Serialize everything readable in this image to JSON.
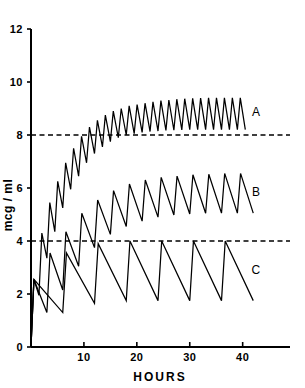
{
  "chart_data": {
    "type": "line",
    "title": "",
    "subtitle": "",
    "xlabel": "HOURS",
    "ylabel": "mcg / ml",
    "xlim": [
      0,
      48
    ],
    "ylim": [
      0,
      12
    ],
    "xticks": [
      10,
      20,
      30,
      40
    ],
    "xtick_labels": [
      "10",
      "20",
      "30",
      "40"
    ],
    "yticks": [
      0,
      2,
      4,
      6,
      8,
      10,
      12
    ],
    "ytick_labels": [
      "0",
      "2",
      "4",
      "6",
      "8",
      "10",
      "12"
    ],
    "grid": false,
    "legend": "inline-right-labels",
    "annotations": [
      {
        "name": "reference-line-8",
        "type": "hline",
        "y": 8,
        "style": "dashed"
      },
      {
        "name": "reference-line-4",
        "type": "hline",
        "y": 4,
        "style": "dashed"
      }
    ],
    "series": [
      {
        "name": "A",
        "label": "A",
        "label_x": 42.5,
        "label_y": 8.85,
        "dose_interval_hours": 1.5,
        "steady_state_peak": 9.4,
        "steady_state_trough": 8.2,
        "points": [
          [
            0.0,
            0.0
          ],
          [
            0.55,
            2.55
          ],
          [
            1.5,
            1.95
          ],
          [
            2.05,
            4.3
          ],
          [
            3.0,
            3.35
          ],
          [
            3.55,
            5.45
          ],
          [
            4.5,
            4.35
          ],
          [
            5.05,
            6.25
          ],
          [
            6.0,
            5.25
          ],
          [
            6.55,
            6.95
          ],
          [
            7.5,
            5.95
          ],
          [
            8.05,
            7.5
          ],
          [
            9.0,
            6.45
          ],
          [
            9.55,
            7.95
          ],
          [
            10.5,
            6.95
          ],
          [
            11.05,
            8.3
          ],
          [
            12.0,
            7.3
          ],
          [
            12.55,
            8.55
          ],
          [
            13.5,
            7.55
          ],
          [
            14.05,
            8.75
          ],
          [
            15.0,
            7.75
          ],
          [
            15.55,
            8.9
          ],
          [
            16.5,
            7.9
          ],
          [
            17.05,
            9.0
          ],
          [
            18.0,
            8.0
          ],
          [
            18.55,
            9.1
          ],
          [
            19.5,
            8.05
          ],
          [
            20.05,
            9.15
          ],
          [
            21.0,
            8.1
          ],
          [
            21.55,
            9.2
          ],
          [
            22.5,
            8.13
          ],
          [
            23.05,
            9.25
          ],
          [
            24.0,
            8.15
          ],
          [
            24.55,
            9.3
          ],
          [
            25.5,
            8.17
          ],
          [
            26.05,
            9.32
          ],
          [
            27.0,
            8.18
          ],
          [
            27.55,
            9.35
          ],
          [
            28.5,
            8.19
          ],
          [
            29.05,
            9.37
          ],
          [
            30.0,
            8.2
          ],
          [
            30.55,
            9.38
          ],
          [
            31.5,
            8.2
          ],
          [
            32.05,
            9.39
          ],
          [
            33.0,
            8.2
          ],
          [
            33.55,
            9.4
          ],
          [
            34.5,
            8.2
          ],
          [
            35.05,
            9.4
          ],
          [
            36.0,
            8.2
          ],
          [
            36.55,
            9.4
          ],
          [
            37.5,
            8.2
          ],
          [
            38.05,
            9.4
          ],
          [
            39.0,
            8.2
          ],
          [
            39.55,
            9.4
          ],
          [
            40.5,
            8.2
          ]
        ]
      },
      {
        "name": "B",
        "label": "B",
        "label_x": 42.5,
        "label_y": 5.85,
        "dose_interval_hours": 3.0,
        "steady_state_peak": 6.55,
        "steady_state_trough": 5.05,
        "points": [
          [
            0.0,
            0.0
          ],
          [
            0.55,
            2.55
          ],
          [
            3.0,
            1.3
          ],
          [
            3.6,
            3.55
          ],
          [
            6.0,
            2.15
          ],
          [
            6.6,
            4.35
          ],
          [
            9.0,
            3.05
          ],
          [
            9.6,
            5.05
          ],
          [
            12.0,
            3.75
          ],
          [
            12.6,
            5.55
          ],
          [
            15.0,
            4.25
          ],
          [
            15.6,
            5.9
          ],
          [
            18.0,
            4.55
          ],
          [
            18.6,
            6.15
          ],
          [
            21.0,
            4.75
          ],
          [
            21.6,
            6.3
          ],
          [
            24.0,
            4.9
          ],
          [
            24.6,
            6.4
          ],
          [
            27.0,
            4.98
          ],
          [
            27.6,
            6.45
          ],
          [
            30.0,
            5.02
          ],
          [
            30.6,
            6.5
          ],
          [
            33.0,
            5.05
          ],
          [
            33.6,
            6.52
          ],
          [
            36.0,
            5.05
          ],
          [
            36.6,
            6.55
          ],
          [
            39.0,
            5.05
          ],
          [
            39.6,
            6.55
          ],
          [
            42.0,
            5.05
          ]
        ]
      },
      {
        "name": "C",
        "label": "C",
        "label_x": 42.5,
        "label_y": 2.9,
        "dose_interval_hours": 6.0,
        "steady_state_peak": 4.0,
        "steady_state_trough": 1.75,
        "points": [
          [
            0.0,
            0.0
          ],
          [
            0.55,
            2.55
          ],
          [
            6.0,
            1.3
          ],
          [
            6.7,
            3.55
          ],
          [
            12.0,
            1.65
          ],
          [
            12.7,
            3.9
          ],
          [
            18.0,
            1.75
          ],
          [
            18.7,
            4.0
          ],
          [
            24.0,
            1.75
          ],
          [
            24.7,
            4.0
          ],
          [
            30.0,
            1.75
          ],
          [
            30.7,
            4.0
          ],
          [
            36.0,
            1.75
          ],
          [
            36.7,
            4.0
          ],
          [
            42.0,
            1.75
          ]
        ]
      }
    ]
  },
  "axes": {
    "x_axis_title": "HOURS",
    "y_axis_title": "mcg / ml"
  }
}
